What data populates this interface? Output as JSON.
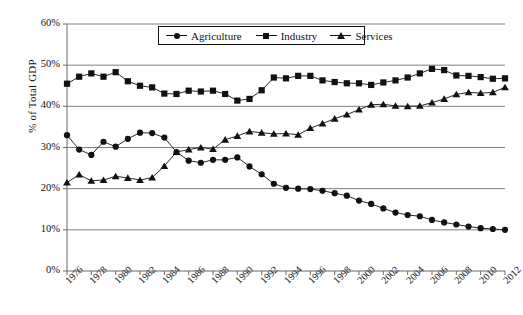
{
  "chart_data": {
    "type": "line",
    "title": "",
    "xlabel": "",
    "ylabel": "% of Total GDP",
    "ylim": [
      0,
      60
    ],
    "xlim": [
      1976,
      2012
    ],
    "ytick_labels": [
      "60%",
      "50%",
      "40%",
      "30%",
      "20%",
      "10%",
      "0%"
    ],
    "ytick_values": [
      60,
      50,
      40,
      30,
      20,
      10,
      0
    ],
    "grid": "horizontal",
    "legend_position": "top-center",
    "x": [
      1976,
      1977,
      1978,
      1979,
      1980,
      1981,
      1982,
      1983,
      1984,
      1985,
      1986,
      1987,
      1988,
      1989,
      1990,
      1991,
      1992,
      1993,
      1994,
      1995,
      1996,
      1997,
      1998,
      1999,
      2000,
      2001,
      2002,
      2003,
      2004,
      2005,
      2006,
      2007,
      2008,
      2009,
      2010,
      2011,
      2012
    ],
    "xtick_labels": [
      "1976",
      "1978",
      "1980",
      "1982",
      "1984",
      "1986",
      "1988",
      "1990",
      "1992",
      "1994",
      "1996",
      "1998",
      "2000",
      "2002",
      "2004",
      "2006",
      "2008",
      "2010",
      "2012"
    ],
    "xtick_values": [
      1976,
      1978,
      1980,
      1982,
      1984,
      1986,
      1988,
      1990,
      1992,
      1994,
      1996,
      1998,
      2000,
      2002,
      2004,
      2006,
      2008,
      2010,
      2012
    ],
    "series": [
      {
        "name": "Agriculture",
        "marker": "circle",
        "values": [
          33.0,
          29.5,
          28.2,
          31.4,
          30.2,
          32.1,
          33.6,
          33.5,
          32.4,
          28.9,
          26.8,
          26.3,
          27.0,
          27.0,
          27.6,
          25.4,
          23.5,
          21.2,
          20.2,
          20.0,
          19.9,
          19.5,
          18.9,
          18.3,
          17.1,
          16.3,
          15.2,
          14.2,
          13.6,
          13.3,
          12.4,
          11.8,
          11.3,
          10.8,
          10.4,
          10.2,
          10.0
        ]
      },
      {
        "name": "Industry",
        "marker": "square",
        "values": [
          45.5,
          47.2,
          48.0,
          47.2,
          48.3,
          46.1,
          45.0,
          44.6,
          43.1,
          43.0,
          43.8,
          43.6,
          43.8,
          43.0,
          41.4,
          41.8,
          43.9,
          47.0,
          46.8,
          47.4,
          47.4,
          46.3,
          45.9,
          45.6,
          45.6,
          45.2,
          45.8,
          46.3,
          47.0,
          48.0,
          49.1,
          48.8,
          47.5,
          47.4,
          47.1,
          46.7,
          46.8
        ]
      },
      {
        "name": "Services",
        "marker": "triangle",
        "values": [
          21.5,
          23.4,
          21.9,
          22.1,
          23.0,
          22.6,
          22.1,
          22.7,
          25.5,
          28.9,
          29.5,
          30.0,
          29.6,
          31.9,
          32.8,
          33.9,
          33.6,
          33.3,
          33.4,
          33.1,
          34.7,
          35.8,
          37.0,
          38.0,
          39.2,
          40.4,
          40.5,
          40.1,
          40.0,
          40.1,
          40.9,
          41.8,
          42.9,
          43.4,
          43.2,
          43.4,
          44.6
        ]
      }
    ]
  },
  "legend": {
    "items": [
      {
        "label": "Agriculture",
        "marker": "circle-marker"
      },
      {
        "label": "Industry",
        "marker": "square-marker"
      },
      {
        "label": "Services",
        "marker": "triangle-marker"
      }
    ]
  },
  "colors": {
    "series": "#111111",
    "grid": "#808080",
    "axis": "#6b6b6b",
    "background": "#ffffff"
  }
}
